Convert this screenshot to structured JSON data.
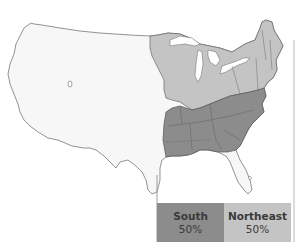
{
  "map": {
    "type": "regional-choropleth",
    "subject": "United States regions",
    "colors": {
      "background_states": "#f7f7f7",
      "south": "#8c8c8c",
      "northeast": "#c4c4c4",
      "border": "#666666",
      "water": "#ffffff"
    }
  },
  "legend": {
    "items": [
      {
        "label": "South",
        "value": "50%",
        "color": "#8c8c8c"
      },
      {
        "label": "Northeast",
        "value": "50%",
        "color": "#c4c4c4"
      }
    ]
  }
}
